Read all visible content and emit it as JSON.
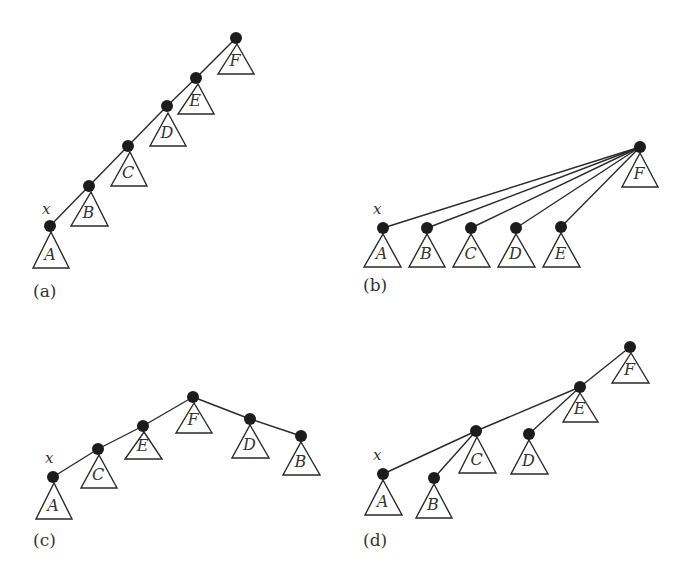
{
  "figure": {
    "node_radius": 6,
    "colors": {
      "node": "#1c1c1c",
      "line": "#2a2a2a",
      "text": "#333333",
      "background": "#ffffff"
    },
    "panels": [
      {
        "id": "a",
        "label": "(a)",
        "label_pos": [
          33,
          297
        ],
        "x_label": "x",
        "x_label_pos": [
          42,
          214
        ],
        "nodes": [
          {
            "id": "x",
            "subtree": "A",
            "pos": [
              50,
              226
            ]
          },
          {
            "id": "nB",
            "subtree": "B",
            "pos": [
              89,
              186
            ]
          },
          {
            "id": "nC",
            "subtree": "C",
            "pos": [
              128,
              146
            ]
          },
          {
            "id": "nD",
            "subtree": "D",
            "pos": [
              167,
              106
            ]
          },
          {
            "id": "nE",
            "subtree": "E",
            "pos": [
              196,
              78
            ]
          },
          {
            "id": "nF",
            "subtree": "F",
            "pos": [
              236,
              38
            ]
          }
        ],
        "edges": [
          [
            "x",
            "nB"
          ],
          [
            "nB",
            "nC"
          ],
          [
            "nC",
            "nD"
          ],
          [
            "nD",
            "nE"
          ],
          [
            "nE",
            "nF"
          ]
        ],
        "triangles": [
          {
            "label": "A",
            "apex": [
              51,
              232
            ],
            "base": [
              33,
              69,
              268
            ]
          },
          {
            "label": "B",
            "apex": [
              91,
              192
            ],
            "base": [
              71,
              108,
              226
            ]
          },
          {
            "label": "C",
            "apex": [
              130,
              152
            ],
            "base": [
              111,
              147,
              186
            ]
          },
          {
            "label": "D",
            "apex": [
              168,
              113
            ],
            "base": [
              150,
              186,
              146
            ]
          },
          {
            "label": "E",
            "apex": [
              198,
              84
            ],
            "base": [
              178,
              214,
              114
            ]
          },
          {
            "label": "F",
            "apex": [
              237,
              44
            ],
            "base": [
              218,
              254,
              74
            ]
          }
        ]
      },
      {
        "id": "b",
        "label": "(b)",
        "label_pos": [
          363,
          291
        ],
        "x_label": "x",
        "x_label_pos": [
          373,
          214
        ],
        "nodes": [
          {
            "id": "x",
            "subtree": "A",
            "pos": [
              383,
              228
            ]
          },
          {
            "id": "nB",
            "subtree": "B",
            "pos": [
              427,
              228
            ]
          },
          {
            "id": "nC",
            "subtree": "C",
            "pos": [
              471,
              228
            ]
          },
          {
            "id": "nD",
            "subtree": "D",
            "pos": [
              516,
              228
            ]
          },
          {
            "id": "nE",
            "subtree": "E",
            "pos": [
              561,
              227
            ]
          },
          {
            "id": "nF",
            "subtree": "F",
            "pos": [
              640,
              147
            ]
          }
        ],
        "edges": [
          [
            "x",
            "nF"
          ],
          [
            "nB",
            "nF"
          ],
          [
            "nC",
            "nF"
          ],
          [
            "nD",
            "nF"
          ],
          [
            "nE",
            "nF"
          ]
        ],
        "triangles": [
          {
            "label": "A",
            "apex": [
              383,
              234
            ],
            "base": [
              364,
              401,
              267
            ]
          },
          {
            "label": "B",
            "apex": [
              427,
              234
            ],
            "base": [
              409,
              445,
              267
            ]
          },
          {
            "label": "C",
            "apex": [
              471,
              234
            ],
            "base": [
              453,
              490,
              267
            ]
          },
          {
            "label": "D",
            "apex": [
              516,
              234
            ],
            "base": [
              498,
              535,
              267
            ]
          },
          {
            "label": "E",
            "apex": [
              561,
              233
            ],
            "base": [
              543,
              580,
              267
            ]
          },
          {
            "label": "F",
            "apex": [
              640,
              153
            ],
            "base": [
              622,
              658,
              187
            ]
          }
        ]
      },
      {
        "id": "c",
        "label": "(c)",
        "label_pos": [
          33,
          546
        ],
        "x_label": "x",
        "x_label_pos": [
          45,
          463
        ],
        "nodes": [
          {
            "id": "x",
            "subtree": "A",
            "pos": [
              53,
              477
            ]
          },
          {
            "id": "nC",
            "subtree": "C",
            "pos": [
              98,
              449
            ]
          },
          {
            "id": "nE",
            "subtree": "E",
            "pos": [
              143,
              426
            ]
          },
          {
            "id": "nF",
            "subtree": "F",
            "pos": [
              193,
              397
            ]
          },
          {
            "id": "nD",
            "subtree": "D",
            "pos": [
              250,
              419
            ]
          },
          {
            "id": "nB",
            "subtree": "B",
            "pos": [
              301,
              436
            ]
          }
        ],
        "edges": [
          [
            "x",
            "nC"
          ],
          [
            "nC",
            "nE"
          ],
          [
            "nE",
            "nF"
          ],
          [
            "nF",
            "nD"
          ],
          [
            "nD",
            "nB"
          ]
        ],
        "triangles": [
          {
            "label": "A",
            "apex": [
              54,
              483
            ],
            "base": [
              36,
              72,
              519
            ]
          },
          {
            "label": "C",
            "apex": [
              99,
              455
            ],
            "base": [
              81,
              117,
              488
            ]
          },
          {
            "label": "E",
            "apex": [
              144,
              432
            ],
            "base": [
              125,
              162,
              459
            ]
          },
          {
            "label": "F",
            "apex": [
              194,
              403
            ],
            "base": [
              176,
              212,
              433
            ]
          },
          {
            "label": "D",
            "apex": [
              250,
              425
            ],
            "base": [
              232,
              269,
              458
            ]
          },
          {
            "label": "B",
            "apex": [
              301,
              442
            ],
            "base": [
              283,
              320,
              475
            ]
          }
        ]
      },
      {
        "id": "d",
        "label": "(d)",
        "label_pos": [
          363,
          546
        ],
        "x_label": "x",
        "x_label_pos": [
          373,
          460
        ],
        "nodes": [
          {
            "id": "x",
            "subtree": "A",
            "pos": [
              383,
              474
            ]
          },
          {
            "id": "nB",
            "subtree": "B",
            "pos": [
              434,
              478
            ]
          },
          {
            "id": "nC",
            "subtree": "C",
            "pos": [
              476,
              431
            ]
          },
          {
            "id": "nD",
            "subtree": "D",
            "pos": [
              529,
              434
            ]
          },
          {
            "id": "nE",
            "subtree": "E",
            "pos": [
              580,
              387
            ]
          },
          {
            "id": "nF",
            "subtree": "F",
            "pos": [
              630,
              347
            ]
          }
        ],
        "edges": [
          [
            "x",
            "nC"
          ],
          [
            "nB",
            "nC"
          ],
          [
            "nC",
            "nE"
          ],
          [
            "nD",
            "nE"
          ],
          [
            "nE",
            "nF"
          ]
        ],
        "triangles": [
          {
            "label": "A",
            "apex": [
              383,
              480
            ],
            "base": [
              365,
              402,
              515
            ]
          },
          {
            "label": "B",
            "apex": [
              434,
              484
            ],
            "base": [
              416,
              452,
              518
            ]
          },
          {
            "label": "C",
            "apex": [
              477,
              437
            ],
            "base": [
              459,
              496,
              473
            ]
          },
          {
            "label": "D",
            "apex": [
              529,
              440
            ],
            "base": [
              511,
              548,
              474
            ]
          },
          {
            "label": "E",
            "apex": [
              580,
              393
            ],
            "base": [
              563,
              598,
              422
            ]
          },
          {
            "label": "F",
            "apex": [
              631,
              353
            ],
            "base": [
              612,
              649,
              383
            ]
          }
        ]
      }
    ]
  }
}
